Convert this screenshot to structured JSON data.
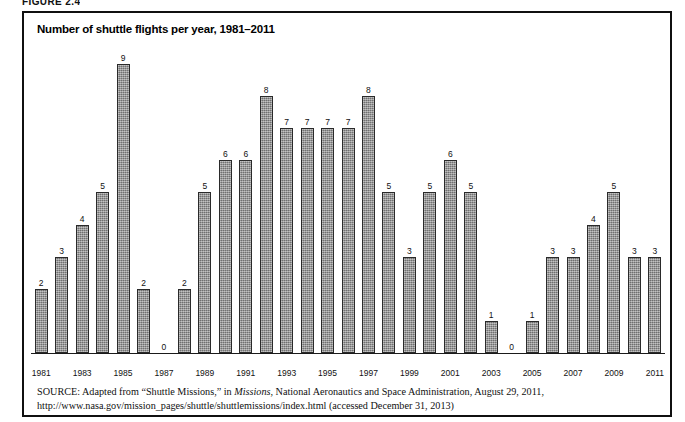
{
  "figure": {
    "label": "FIGURE 2.4"
  },
  "chart_title": "Number of shuttle flights per year, 1981–2011",
  "source": {
    "label": "SOURCE:",
    "text_before_italic": " Adapted from “Shuttle Missions,” in ",
    "italic_title": "Missions",
    "text_after_italic": ", National Aeronautics and Space Administration, August 29, 2011, http://www.nasa.gov/mission_pages/shuttle/shuttlemissions/index.html (accessed December 31, 2013)"
  },
  "chart_data": {
    "type": "bar",
    "title": "Number of shuttle flights per year, 1981–2011",
    "xlabel": "",
    "ylabel": "",
    "ylim": [
      0,
      9
    ],
    "grid": false,
    "legend": null,
    "categories": [
      "1981",
      "1982",
      "1983",
      "1984",
      "1985",
      "1986",
      "1987",
      "1988",
      "1989",
      "1990",
      "1991",
      "1992",
      "1993",
      "1994",
      "1995",
      "1996",
      "1997",
      "1998",
      "1999",
      "2000",
      "2001",
      "2002",
      "2003",
      "2004",
      "2005",
      "2006",
      "2007",
      "2008",
      "2009",
      "2010",
      "2011"
    ],
    "values": [
      2,
      3,
      4,
      5,
      9,
      2,
      0,
      2,
      5,
      6,
      6,
      8,
      7,
      7,
      7,
      7,
      8,
      5,
      3,
      5,
      6,
      5,
      1,
      0,
      1,
      3,
      3,
      4,
      5,
      3,
      3
    ],
    "data_labels": [
      "2",
      "3",
      "4",
      "5",
      "9",
      "2",
      "0",
      "2",
      "5",
      "6",
      "6",
      "8",
      "7",
      "7",
      "7",
      "7",
      "8",
      "5",
      "3",
      "5",
      "6",
      "5",
      "1",
      "0",
      "1",
      "3",
      "3",
      "4",
      "5",
      "3",
      "3"
    ],
    "tick_labels": [
      "1981",
      "",
      "1983",
      "",
      "1985",
      "",
      "1987",
      "",
      "1989",
      "",
      "1991",
      "",
      "1993",
      "",
      "1995",
      "",
      "1997",
      "",
      "1999",
      "",
      "2001",
      "",
      "2003",
      "",
      "2005",
      "",
      "2007",
      "",
      "2009",
      "",
      "2011"
    ],
    "bar_color": "#8e8e8e",
    "bar_border_color": "#2a2a2a"
  }
}
